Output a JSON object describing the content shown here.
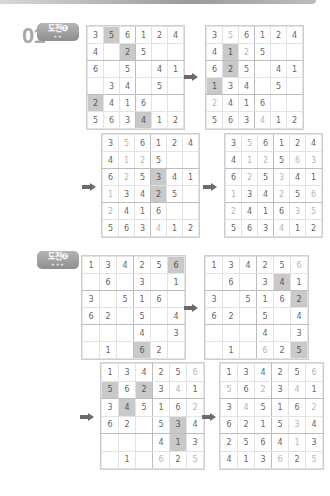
{
  "header": {
    "problem_number": "01"
  },
  "badges": [
    {
      "label": "도전❶",
      "stars": "★★"
    },
    {
      "label": "도전❷",
      "stars": "★★★"
    }
  ],
  "colors": {
    "shade": "#c9c9c9",
    "light_digit": "#b5b5b5",
    "digit": "#666666",
    "arrow": "#6a6a6a",
    "badge": "#9e9e9e"
  },
  "grids": [
    {
      "id": "challenge1-step1",
      "cells": [
        [
          "3",
          "5",
          "6",
          "1",
          "2",
          "4"
        ],
        [
          "4",
          "",
          "2",
          "5",
          "",
          ""
        ],
        [
          "6",
          "",
          "5",
          "",
          "4",
          "1"
        ],
        [
          "",
          "3",
          "4",
          "",
          "5",
          ""
        ],
        [
          "2",
          "4",
          "1",
          "6",
          "",
          ""
        ],
        [
          "5",
          "6",
          "3",
          "4",
          "1",
          "2"
        ]
      ],
      "shaded": [
        [
          0,
          1
        ],
        [
          1,
          2
        ],
        [
          4,
          0
        ],
        [
          5,
          3
        ]
      ],
      "light": []
    },
    {
      "id": "challenge1-step2",
      "cells": [
        [
          "3",
          "5",
          "6",
          "1",
          "2",
          "4"
        ],
        [
          "4",
          "1",
          "2",
          "5",
          "",
          ""
        ],
        [
          "6",
          "2",
          "5",
          "",
          "4",
          "1"
        ],
        [
          "1",
          "3",
          "4",
          "",
          "5",
          ""
        ],
        [
          "2",
          "4",
          "1",
          "6",
          "",
          ""
        ],
        [
          "5",
          "6",
          "3",
          "4",
          "1",
          "2"
        ]
      ],
      "shaded": [
        [
          1,
          1
        ],
        [
          2,
          1
        ],
        [
          3,
          0
        ]
      ],
      "light": [
        [
          0,
          1
        ],
        [
          1,
          2
        ],
        [
          4,
          0
        ],
        [
          5,
          3
        ]
      ]
    },
    {
      "id": "challenge1-step3",
      "cells": [
        [
          "3",
          "5",
          "6",
          "1",
          "2",
          "4"
        ],
        [
          "4",
          "1",
          "2",
          "5",
          "",
          ""
        ],
        [
          "6",
          "2",
          "5",
          "3",
          "4",
          "1"
        ],
        [
          "1",
          "3",
          "4",
          "2",
          "5",
          ""
        ],
        [
          "2",
          "4",
          "1",
          "6",
          "",
          ""
        ],
        [
          "5",
          "6",
          "3",
          "4",
          "1",
          "2"
        ]
      ],
      "shaded": [
        [
          2,
          3
        ],
        [
          3,
          3
        ]
      ],
      "light": [
        [
          0,
          1
        ],
        [
          1,
          1
        ],
        [
          1,
          2
        ],
        [
          2,
          1
        ],
        [
          3,
          0
        ],
        [
          4,
          0
        ],
        [
          5,
          3
        ]
      ]
    },
    {
      "id": "challenge1-solution",
      "cells": [
        [
          "3",
          "5",
          "6",
          "1",
          "2",
          "4"
        ],
        [
          "4",
          "1",
          "2",
          "5",
          "6",
          "3"
        ],
        [
          "6",
          "2",
          "5",
          "3",
          "4",
          "1"
        ],
        [
          "1",
          "3",
          "4",
          "2",
          "5",
          "6"
        ],
        [
          "2",
          "4",
          "1",
          "6",
          "3",
          "5"
        ],
        [
          "5",
          "6",
          "3",
          "4",
          "1",
          "2"
        ]
      ],
      "shaded": [],
      "light": [
        [
          0,
          1
        ],
        [
          1,
          1
        ],
        [
          1,
          2
        ],
        [
          1,
          4
        ],
        [
          1,
          5
        ],
        [
          2,
          1
        ],
        [
          2,
          3
        ],
        [
          3,
          0
        ],
        [
          3,
          3
        ],
        [
          3,
          5
        ],
        [
          4,
          0
        ],
        [
          4,
          4
        ],
        [
          4,
          5
        ],
        [
          5,
          3
        ]
      ]
    },
    {
      "id": "challenge2-step1",
      "cells": [
        [
          "1",
          "3",
          "4",
          "2",
          "5",
          "6"
        ],
        [
          "",
          "6",
          "",
          "3",
          "",
          "1"
        ],
        [
          "3",
          "",
          "5",
          "1",
          "6",
          ""
        ],
        [
          "6",
          "2",
          "",
          "5",
          "",
          "4"
        ],
        [
          "",
          "",
          "",
          "4",
          "",
          "3"
        ],
        [
          "",
          "1",
          "",
          "6",
          "2",
          ""
        ]
      ],
      "shaded": [
        [
          0,
          5
        ],
        [
          5,
          3
        ]
      ],
      "light": []
    },
    {
      "id": "challenge2-step2",
      "cells": [
        [
          "1",
          "3",
          "4",
          "2",
          "5",
          "6"
        ],
        [
          "",
          "6",
          "",
          "3",
          "4",
          "1"
        ],
        [
          "3",
          "",
          "5",
          "1",
          "6",
          "2"
        ],
        [
          "6",
          "2",
          "",
          "5",
          "",
          "4"
        ],
        [
          "",
          "",
          "",
          "4",
          "",
          "3"
        ],
        [
          "",
          "1",
          "",
          "6",
          "2",
          "5"
        ]
      ],
      "shaded": [
        [
          1,
          4
        ],
        [
          2,
          5
        ],
        [
          5,
          5
        ]
      ],
      "light": [
        [
          0,
          5
        ],
        [
          5,
          3
        ]
      ]
    },
    {
      "id": "challenge2-step3",
      "cells": [
        [
          "1",
          "3",
          "4",
          "2",
          "5",
          "6"
        ],
        [
          "5",
          "6",
          "2",
          "3",
          "4",
          "1"
        ],
        [
          "3",
          "4",
          "5",
          "1",
          "6",
          "2"
        ],
        [
          "6",
          "2",
          "",
          "5",
          "3",
          "4"
        ],
        [
          "",
          "",
          "",
          "4",
          "1",
          "3"
        ],
        [
          "",
          "1",
          "",
          "6",
          "2",
          "5"
        ]
      ],
      "shaded": [
        [
          1,
          0
        ],
        [
          1,
          2
        ],
        [
          2,
          1
        ],
        [
          3,
          4
        ],
        [
          4,
          4
        ]
      ],
      "light": [
        [
          0,
          5
        ],
        [
          1,
          4
        ],
        [
          2,
          5
        ],
        [
          5,
          3
        ],
        [
          5,
          5
        ]
      ]
    },
    {
      "id": "challenge2-solution",
      "cells": [
        [
          "1",
          "3",
          "4",
          "2",
          "5",
          "6"
        ],
        [
          "5",
          "6",
          "2",
          "3",
          "4",
          "1"
        ],
        [
          "3",
          "4",
          "5",
          "1",
          "6",
          "2"
        ],
        [
          "6",
          "2",
          "1",
          "5",
          "3",
          "4"
        ],
        [
          "2",
          "5",
          "6",
          "4",
          "1",
          "3"
        ],
        [
          "4",
          "1",
          "3",
          "6",
          "2",
          "5"
        ]
      ],
      "shaded": [],
      "light": [
        [
          0,
          5
        ],
        [
          1,
          0
        ],
        [
          1,
          2
        ],
        [
          1,
          4
        ],
        [
          2,
          1
        ],
        [
          2,
          5
        ],
        [
          3,
          4
        ],
        [
          4,
          4
        ],
        [
          5,
          3
        ],
        [
          5,
          5
        ]
      ]
    }
  ],
  "arrows": [
    "right-arrow",
    "right-arrow",
    "right-arrow",
    "right-arrow",
    "right-arrow",
    "right-arrow"
  ]
}
